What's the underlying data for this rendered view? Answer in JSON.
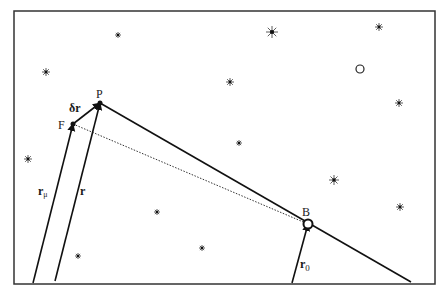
{
  "figure": {
    "frame": {
      "x": 14,
      "y": 11,
      "width": 421,
      "height": 273
    },
    "points": {
      "P": {
        "label": "P",
        "x": 100,
        "y": 103
      },
      "F": {
        "label": "F",
        "x": 73,
        "y": 124
      },
      "B": {
        "label": "B",
        "x": 308,
        "y": 224
      }
    },
    "vectors": {
      "r_mu": {
        "label": "r",
        "subscript": "μ",
        "from": [
          33,
          283
        ],
        "to": [
          73,
          124
        ]
      },
      "r": {
        "label": "r",
        "from": [
          55,
          281
        ],
        "to": [
          100,
          103
        ]
      },
      "dr": {
        "label": "δr",
        "from": [
          73,
          124
        ],
        "to": [
          100,
          103
        ]
      },
      "r0": {
        "label": "r",
        "subscript": "0",
        "from": [
          292,
          283
        ],
        "to": [
          308,
          224
        ]
      }
    },
    "lines": {
      "trajectory": {
        "from": [
          100,
          103
        ],
        "to": [
          411,
          282
        ],
        "style": "solid"
      },
      "sightline": {
        "from": [
          73,
          124
        ],
        "to": [
          308,
          224
        ],
        "style": "dotted"
      }
    },
    "stars": [
      {
        "x": 118,
        "y": 35,
        "size": 3
      },
      {
        "x": 272,
        "y": 32,
        "size": 6
      },
      {
        "x": 379,
        "y": 27,
        "size": 4
      },
      {
        "x": 46,
        "y": 72,
        "size": 4
      },
      {
        "x": 230,
        "y": 82,
        "size": 4
      },
      {
        "x": 399,
        "y": 103,
        "size": 4
      },
      {
        "x": 239,
        "y": 143,
        "size": 3
      },
      {
        "x": 28,
        "y": 159,
        "size": 4
      },
      {
        "x": 334,
        "y": 180,
        "size": 5
      },
      {
        "x": 400,
        "y": 207,
        "size": 4
      },
      {
        "x": 157,
        "y": 212,
        "size": 3
      },
      {
        "x": 202,
        "y": 248,
        "size": 3
      },
      {
        "x": 78,
        "y": 256,
        "size": 3
      }
    ],
    "moon": {
      "x": 360,
      "y": 69,
      "r": 4
    }
  }
}
